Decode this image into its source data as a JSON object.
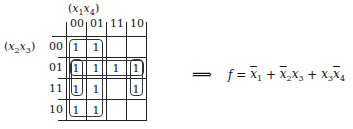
{
  "kmap": {
    "col_var_label": "(x1x4)",
    "row_var_label": "(x2x3)",
    "col_headers": [
      "00",
      "01",
      "11",
      "10"
    ],
    "row_headers": [
      "00",
      "01",
      "11",
      "10"
    ],
    "cells": [
      [
        "1",
        "1",
        "",
        ""
      ],
      [
        "1",
        "1",
        "1",
        "1"
      ],
      [
        "1",
        "1",
        "",
        "1"
      ],
      [
        "1",
        "1",
        "",
        ""
      ]
    ],
    "groups": [
      {
        "name": "x1-bar",
        "rows": [
          0,
          3
        ],
        "cols": [
          0,
          1
        ]
      },
      {
        "name": "x2-bar-x3",
        "rows": [
          1,
          1
        ],
        "cols": [
          0,
          3
        ]
      },
      {
        "name": "x3-x4-bar",
        "rows": [
          1,
          2
        ],
        "cols": [
          0,
          0
        ]
      },
      {
        "name": "x3-x4-bar-wrap",
        "rows": [
          1,
          2
        ],
        "cols": [
          3,
          3
        ]
      }
    ]
  },
  "arrow": "⟹",
  "formula": {
    "lhs": "f",
    "equals": "=",
    "terms": [
      {
        "vars": [
          {
            "v": "x",
            "sub": "1",
            "bar": true
          }
        ]
      },
      {
        "vars": [
          {
            "v": "x",
            "sub": "2",
            "bar": true
          },
          {
            "v": "x",
            "sub": "3",
            "bar": false
          }
        ]
      },
      {
        "vars": [
          {
            "v": "x",
            "sub": "3",
            "bar": false
          },
          {
            "v": "x",
            "sub": "4",
            "bar": true
          }
        ]
      }
    ],
    "plus": "+",
    "text": "f = x̄1 + x̄2x3 + x3x̄4"
  }
}
